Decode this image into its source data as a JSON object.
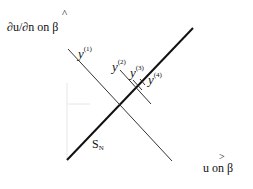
{
  "axes": {
    "y_label": "∂u/∂n on β",
    "y_hat": "^",
    "x_label": "u on β",
    "x_hat": ">"
  },
  "lines": {
    "sn": {
      "label": "S",
      "sub": "N"
    },
    "y1": {
      "label": "y",
      "sup": "(1)"
    },
    "y2": {
      "label": "y",
      "sup": "(2)"
    },
    "y3": {
      "label": "y",
      "sup": "(3)"
    },
    "y4": {
      "label": "y",
      "sup": "(4)"
    }
  }
}
